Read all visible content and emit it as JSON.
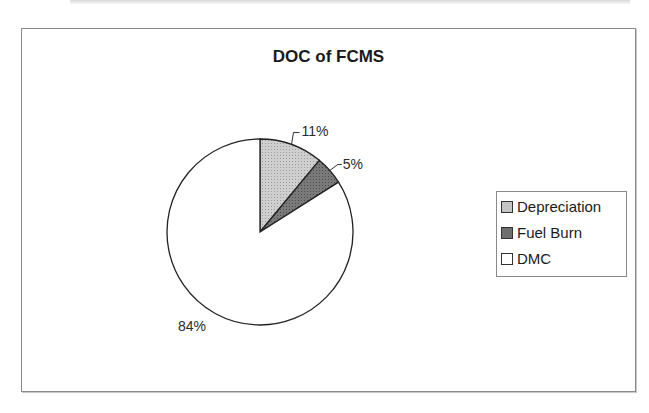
{
  "chart_data": {
    "type": "pie",
    "title": "DOC of FCMS",
    "categories": [
      "Depreciation",
      "Fuel Burn",
      "DMC"
    ],
    "values": [
      11,
      5,
      84
    ],
    "unit": "%",
    "data_labels": [
      "11%",
      "5%",
      "84%"
    ],
    "colors": [
      "#c4c4c4",
      "#6e6e6e",
      "#ffffff"
    ],
    "legend_position": "right",
    "start_angle": "12 o'clock, clockwise"
  },
  "legend": {
    "items": [
      {
        "label": "Depreciation",
        "color": "#c4c4c4"
      },
      {
        "label": "Fuel Burn",
        "color": "#6e6e6e"
      },
      {
        "label": "DMC",
        "color": "#ffffff"
      }
    ]
  }
}
